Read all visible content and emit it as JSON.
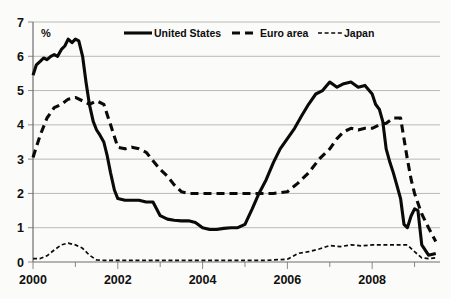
{
  "chart_data": {
    "type": "line",
    "title": "",
    "subtitle": "",
    "unit_label": "%",
    "xlabel": "",
    "ylabel": "",
    "xlim": [
      2000.0,
      2009.6
    ],
    "ylim": [
      0,
      7
    ],
    "ytick_labels": [
      "0",
      "1",
      "2",
      "3",
      "4",
      "5",
      "6",
      "7"
    ],
    "ytick_values": [
      0,
      1,
      2,
      3,
      4,
      5,
      6,
      7
    ],
    "xtick_labels": [
      "2000",
      "2002",
      "2004",
      "2006",
      "2008"
    ],
    "xtick_values": [
      2000,
      2002,
      2004,
      2006,
      2008
    ],
    "xminor_ticks": [
      2001,
      2003,
      2005,
      2007,
      2009
    ],
    "grid": "horizontal",
    "legend_position": "top-center",
    "legend": [
      {
        "name": "United States",
        "style": "solid"
      },
      {
        "name": "Euro area",
        "style": "dashed"
      },
      {
        "name": "Japan",
        "style": "dotted"
      }
    ],
    "series": [
      {
        "name": "United States",
        "style": "solid",
        "x": [
          2000.0,
          2000.08,
          2000.17,
          2000.25,
          2000.33,
          2000.42,
          2000.5,
          2000.58,
          2000.67,
          2000.75,
          2000.83,
          2000.92,
          2001.0,
          2001.08,
          2001.17,
          2001.25,
          2001.33,
          2001.42,
          2001.5,
          2001.58,
          2001.67,
          2001.75,
          2001.83,
          2001.92,
          2002.0,
          2002.17,
          2002.33,
          2002.5,
          2002.67,
          2002.83,
          2003.0,
          2003.17,
          2003.33,
          2003.5,
          2003.67,
          2003.83,
          2004.0,
          2004.17,
          2004.33,
          2004.5,
          2004.67,
          2004.83,
          2005.0,
          2005.17,
          2005.33,
          2005.5,
          2005.67,
          2005.83,
          2006.0,
          2006.17,
          2006.33,
          2006.5,
          2006.67,
          2006.83,
          2007.0,
          2007.17,
          2007.33,
          2007.5,
          2007.67,
          2007.83,
          2008.0,
          2008.08,
          2008.17,
          2008.25,
          2008.33,
          2008.42,
          2008.5,
          2008.58,
          2008.67,
          2008.75,
          2008.83,
          2008.92,
          2009.0,
          2009.08,
          2009.17,
          2009.33,
          2009.5
        ],
        "y": [
          5.45,
          5.75,
          5.85,
          5.95,
          5.9,
          6.0,
          6.05,
          6.0,
          6.2,
          6.3,
          6.5,
          6.4,
          6.5,
          6.45,
          6.0,
          5.25,
          4.6,
          4.1,
          3.85,
          3.7,
          3.5,
          3.1,
          2.6,
          2.1,
          1.85,
          1.8,
          1.8,
          1.8,
          1.75,
          1.75,
          1.35,
          1.25,
          1.22,
          1.2,
          1.2,
          1.15,
          1.0,
          0.95,
          0.95,
          0.98,
          1.0,
          1.0,
          1.1,
          1.55,
          2.0,
          2.4,
          2.9,
          3.3,
          3.6,
          3.9,
          4.25,
          4.6,
          4.9,
          5.0,
          5.25,
          5.1,
          5.2,
          5.25,
          5.1,
          5.15,
          4.9,
          4.6,
          4.45,
          4.1,
          3.3,
          2.9,
          2.6,
          2.25,
          1.85,
          1.1,
          1.0,
          1.35,
          1.55,
          1.5,
          0.5,
          0.2,
          0.25
        ]
      },
      {
        "name": "Euro area",
        "style": "dashed",
        "x": [
          2000.0,
          2000.17,
          2000.33,
          2000.5,
          2000.67,
          2000.83,
          2001.0,
          2001.17,
          2001.33,
          2001.5,
          2001.67,
          2001.83,
          2002.0,
          2002.17,
          2002.33,
          2002.5,
          2002.67,
          2002.83,
          2003.0,
          2003.17,
          2003.33,
          2003.5,
          2003.67,
          2003.83,
          2004.0,
          2004.33,
          2004.67,
          2005.0,
          2005.33,
          2005.67,
          2006.0,
          2006.25,
          2006.5,
          2006.75,
          2007.0,
          2007.17,
          2007.33,
          2007.5,
          2007.67,
          2007.83,
          2008.0,
          2008.17,
          2008.33,
          2008.5,
          2008.67,
          2008.83,
          2008.92,
          2009.0,
          2009.17,
          2009.33,
          2009.5
        ],
        "y": [
          3.05,
          3.7,
          4.2,
          4.5,
          4.6,
          4.75,
          4.8,
          4.7,
          4.6,
          4.7,
          4.6,
          4.0,
          3.35,
          3.3,
          3.35,
          3.3,
          3.2,
          2.95,
          2.7,
          2.5,
          2.25,
          2.05,
          2.0,
          2.0,
          2.0,
          2.0,
          2.0,
          2.0,
          2.0,
          2.0,
          2.05,
          2.3,
          2.6,
          3.0,
          3.3,
          3.6,
          3.8,
          3.9,
          3.85,
          3.9,
          3.9,
          4.0,
          4.05,
          4.2,
          4.2,
          3.0,
          2.4,
          2.0,
          1.4,
          1.0,
          0.6
        ]
      },
      {
        "name": "Japan",
        "style": "dotted",
        "x": [
          2000.0,
          2000.17,
          2000.33,
          2000.5,
          2000.67,
          2000.83,
          2001.0,
          2001.17,
          2001.33,
          2001.5,
          2001.67,
          2002.0,
          2002.5,
          2003.0,
          2003.5,
          2004.0,
          2004.5,
          2005.0,
          2005.5,
          2006.0,
          2006.25,
          2006.5,
          2006.75,
          2007.0,
          2007.25,
          2007.5,
          2007.75,
          2008.0,
          2008.5,
          2008.83,
          2009.0,
          2009.17,
          2009.33,
          2009.5
        ],
        "y": [
          0.1,
          0.1,
          0.18,
          0.35,
          0.5,
          0.55,
          0.5,
          0.4,
          0.2,
          0.06,
          0.05,
          0.05,
          0.05,
          0.05,
          0.05,
          0.05,
          0.05,
          0.05,
          0.05,
          0.08,
          0.25,
          0.3,
          0.38,
          0.48,
          0.45,
          0.5,
          0.47,
          0.5,
          0.5,
          0.5,
          0.3,
          0.12,
          0.1,
          0.12
        ]
      }
    ]
  }
}
